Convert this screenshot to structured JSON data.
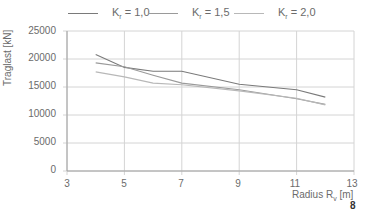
{
  "legend": [
    {
      "prefix": "K",
      "sub": "r",
      "suffix": " = 1,0",
      "color": "#7a7a7a"
    },
    {
      "prefix": "K",
      "sub": "r",
      "suffix": " = 1,5",
      "color": "#9a9a9a"
    },
    {
      "prefix": "K",
      "sub": "r",
      "suffix": " = 2,0",
      "color": "#b8b8b8"
    }
  ],
  "axes": {
    "ylabel": "Traglast [kN]",
    "xlabel_prefix": "Radius R",
    "xlabel_sub": "v",
    "xlabel_suffix": " [m]",
    "yticks": [
      "25000",
      "20000",
      "15000",
      "10000",
      "5000",
      "0"
    ],
    "xticks": [
      "3",
      "5",
      "7",
      "9",
      "11",
      "13"
    ]
  },
  "page_number": "8",
  "chart_data": {
    "type": "line",
    "title": "",
    "xlabel": "Radius Rv [m]",
    "ylabel": "Traglast [kN]",
    "xlim": [
      3,
      13
    ],
    "ylim": [
      0,
      25000
    ],
    "grid": true,
    "legend_position": "top",
    "x": [
      4,
      5,
      6,
      7,
      9,
      11,
      12
    ],
    "series": [
      {
        "name": "Kr = 1,0",
        "values": [
          20800,
          18500,
          17800,
          17800,
          15500,
          14500,
          13200
        ]
      },
      {
        "name": "Kr = 1,5",
        "values": [
          19300,
          18600,
          17100,
          15700,
          14500,
          12900,
          11900
        ]
      },
      {
        "name": "Kr = 2,0",
        "values": [
          17700,
          16800,
          15700,
          15400,
          14300,
          13000,
          11800
        ]
      }
    ]
  }
}
